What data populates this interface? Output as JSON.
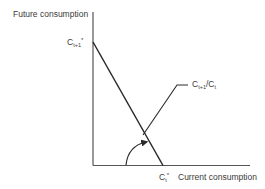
{
  "diagram": {
    "y_axis_label": "Future consumption",
    "x_axis_label": "Current consumption",
    "y_intercept_label": {
      "base": "C",
      "sub": "t+1",
      "sup": "*"
    },
    "x_intercept_label": {
      "base": "C",
      "sub": "t",
      "sup": "*"
    },
    "slope_label": {
      "base1": "C",
      "sub1": "t+1",
      "sep": "/",
      "base2": "C",
      "sub2": "t"
    },
    "line_color": "#2a2a2a",
    "axis_color": "#555555"
  }
}
